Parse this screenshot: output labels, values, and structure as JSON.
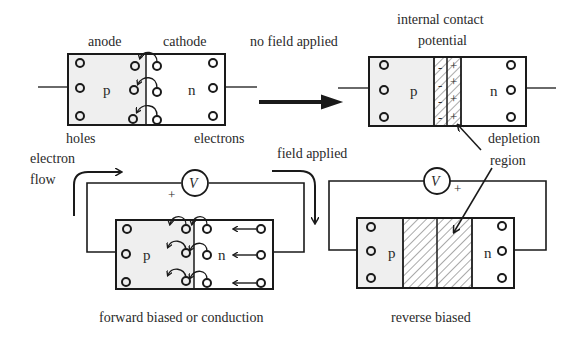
{
  "diagram": {
    "colors": {
      "ink": "#1a1a1a",
      "p_region_fill": "#efefef",
      "n_region_fill": "#ffffff",
      "text": "#2a2a2a"
    },
    "panels": {
      "unbiased": {
        "labels": {
          "anode": "anode",
          "cathode": "cathode",
          "holes": "holes",
          "electrons": "electrons",
          "p": "p",
          "n": "n"
        }
      },
      "equilibrium": {
        "labels": {
          "internal_contact_line1": "internal contact",
          "internal_contact_line2": "potential",
          "p": "p",
          "n": "n",
          "depletion_line1": "depletion",
          "depletion_line2": "region",
          "minus": "-",
          "plus": "+"
        }
      },
      "forward": {
        "labels": {
          "electron_line1": "electron",
          "electron_line2": "flow",
          "voltage": "V",
          "plus": "+",
          "p": "p",
          "n": "n",
          "caption": "forward biased or conduction"
        }
      },
      "reverse": {
        "labels": {
          "voltage": "V",
          "plus": "+",
          "p": "p",
          "n": "n",
          "caption": "reverse biased"
        }
      }
    },
    "transitions": {
      "no_field": "no field applied",
      "field": "field applied"
    }
  }
}
